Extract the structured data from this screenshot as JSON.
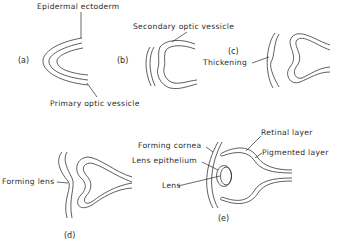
{
  "figure": {
    "panels": [
      {
        "id": "a",
        "label": "(a)",
        "annotations": [
          "Epidermal ectoderm",
          "Primary optic vessicle"
        ]
      },
      {
        "id": "b",
        "label": "(b)",
        "annotations": [
          "Secondary optic vessicle"
        ]
      },
      {
        "id": "c",
        "label": "(c)",
        "annotations": [
          "Thickening"
        ]
      },
      {
        "id": "d",
        "label": "(d)",
        "annotations": [
          "Forming lens"
        ]
      },
      {
        "id": "e",
        "label": "(e)",
        "annotations": [
          "Forming cornea",
          "Lens epithelium",
          "Lens",
          "Retinal layer",
          "Pigmented layer"
        ]
      }
    ]
  },
  "labels": {
    "epidermal_ectoderm": "Epidermal ectoderm",
    "primary_optic_vessicle": "Primary optic vessicle",
    "secondary_optic_vessicle": "Secondary optic vessicle",
    "thickening": "Thickening",
    "forming_lens": "Forming lens",
    "forming_cornea": "Forming cornea",
    "lens_epithelium": "Lens epithelium",
    "lens": "Lens",
    "retinal_layer": "Retinal layer",
    "pigmented_layer": "Pigmented layer",
    "panel_a": "(a)",
    "panel_b": "(b)",
    "panel_c": "(c)",
    "panel_d": "(d)",
    "panel_e": "(e)"
  }
}
